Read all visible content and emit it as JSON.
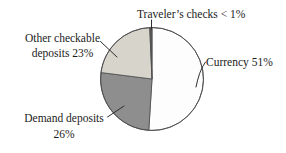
{
  "chart_data": {
    "type": "pie",
    "title": "",
    "direction": "clockwise",
    "start_angle_deg": 0,
    "outline_color": "#4d4d4d",
    "leader_line_color": "#2e2e2e",
    "background_color": "#ffffff",
    "text_color": "#1b1b1b",
    "slices": [
      {
        "name": "Currency",
        "stated_share": "51%",
        "value": 51,
        "color": "#fdfdfd",
        "label": "Currency 51%"
      },
      {
        "name": "Demand deposits",
        "stated_share": "26%",
        "value": 26,
        "color": "#8e8e8e",
        "label_lines": [
          "Demand deposits",
          "26%"
        ]
      },
      {
        "name": "Other checkable deposits",
        "stated_share": "23%",
        "value": 22.3,
        "color": "#d6d4cb",
        "label_lines": [
          "Other checkable",
          "deposits 23%"
        ]
      },
      {
        "name": "Traveler's checks",
        "stated_share": "< 1%",
        "value": 0.7,
        "color": "#5a5a5a",
        "label": "Traveler’s checks < 1%"
      }
    ]
  }
}
